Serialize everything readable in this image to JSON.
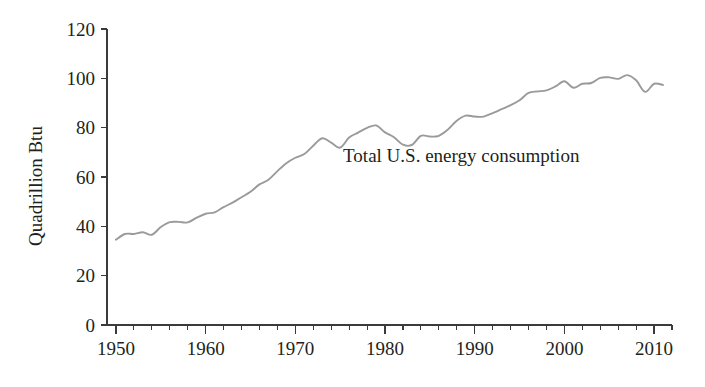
{
  "chart_data": {
    "type": "line",
    "title": "",
    "xlabel": "",
    "ylabel": "Quadrillion Btu",
    "xlim": [
      1949,
      2012
    ],
    "ylim": [
      0,
      120
    ],
    "grid": false,
    "legend_position": "none",
    "line_color": "#9a9a9a",
    "axis_color": "#3b3b3b",
    "text_color": "#231f20",
    "background": "#ffffff",
    "xticks": [
      1950,
      1960,
      1970,
      1980,
      1990,
      2000,
      2010
    ],
    "xtick_labels": [
      "1950",
      "1960",
      "1970",
      "1980",
      "1990",
      "2000",
      "2010"
    ],
    "xtick_minor_step": 2,
    "yticks": [
      0,
      20,
      40,
      60,
      80,
      100,
      120
    ],
    "ytick_labels": [
      "0",
      "20",
      "40",
      "60",
      "80",
      "100",
      "120"
    ],
    "annotations": [
      {
        "text": "Total U.S. energy consumption",
        "x": 1988.5,
        "y": 66
      }
    ],
    "series": [
      {
        "name": "Total U.S. energy consumption",
        "x": [
          1950,
          1951,
          1952,
          1953,
          1954,
          1955,
          1956,
          1957,
          1958,
          1959,
          1960,
          1961,
          1962,
          1963,
          1964,
          1965,
          1966,
          1967,
          1968,
          1969,
          1970,
          1971,
          1972,
          1973,
          1974,
          1975,
          1976,
          1977,
          1978,
          1979,
          1980,
          1981,
          1982,
          1983,
          1984,
          1985,
          1986,
          1987,
          1988,
          1989,
          1990,
          1991,
          1992,
          1993,
          1994,
          1995,
          1996,
          1997,
          1998,
          1999,
          2000,
          2001,
          2002,
          2003,
          2004,
          2005,
          2006,
          2007,
          2008,
          2009,
          2010,
          2011
        ],
        "values": [
          34.6,
          36.9,
          36.9,
          37.6,
          36.6,
          39.7,
          41.7,
          41.8,
          41.6,
          43.5,
          45.1,
          45.7,
          47.8,
          49.6,
          51.8,
          54.0,
          57.0,
          58.9,
          62.4,
          65.6,
          67.8,
          69.3,
          72.7,
          75.7,
          73.9,
          71.9,
          76.0,
          78.0,
          79.9,
          80.9,
          78.1,
          76.1,
          73.1,
          73.0,
          76.7,
          76.4,
          76.7,
          79.2,
          82.8,
          84.9,
          84.5,
          84.5,
          85.9,
          87.5,
          89.1,
          91.1,
          94.1,
          94.7,
          95.1,
          96.7,
          98.8,
          96.2,
          97.8,
          98.1,
          100.2,
          100.4,
          99.8,
          101.3,
          99.2,
          94.5,
          97.8,
          97.3
        ]
      }
    ]
  }
}
